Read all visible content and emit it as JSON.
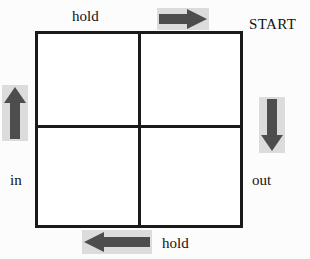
{
  "diagram": {
    "grid": {
      "rows": 2,
      "columns": 2,
      "cells": [
        "",
        "",
        "",
        ""
      ],
      "border_color": "#1a1a1a",
      "fill_color": "#ffffff"
    },
    "labels": {
      "top": "hold",
      "bottom": "hold",
      "left": "in",
      "right": "out",
      "start": "START"
    },
    "arrows": [
      {
        "name": "arrow-right",
        "direction": "right",
        "position": "top",
        "color": "#4d4d4d",
        "pad_color": "#dcdcdc"
      },
      {
        "name": "arrow-down",
        "direction": "down",
        "position": "right",
        "color": "#4d4d4d",
        "pad_color": "#dcdcdc"
      },
      {
        "name": "arrow-left",
        "direction": "left",
        "position": "bottom",
        "color": "#4d4d4d",
        "pad_color": "#dcdcdc"
      },
      {
        "name": "arrow-up",
        "direction": "up",
        "position": "left",
        "color": "#4d4d4d",
        "pad_color": "#dcdcdc"
      }
    ]
  }
}
